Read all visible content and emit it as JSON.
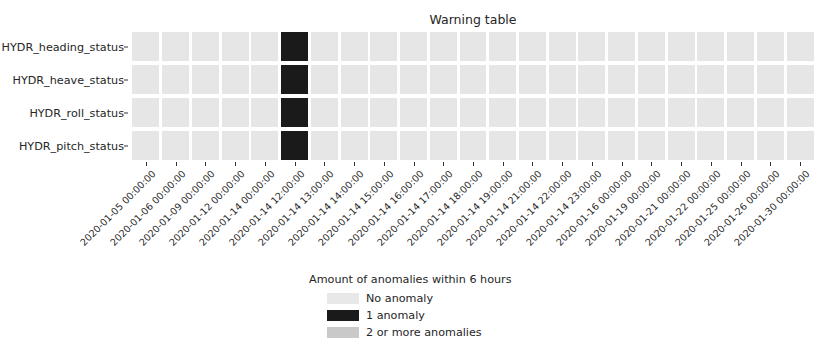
{
  "chart_data": {
    "type": "heatmap",
    "title": "Warning table",
    "xlabel": "",
    "ylabel": "",
    "grid": false,
    "legend_position": "below-center",
    "rows": [
      "HYDR_heading_status",
      "HYDR_heave_status",
      "HYDR_roll_status",
      "HYDR_pitch_status"
    ],
    "categories": [
      "2020-01-05 00:00:00",
      "2020-01-06 00:00:00",
      "2020-01-09 00:00:00",
      "2020-01-12 00:00:00",
      "2020-01-14 00:00:00",
      "2020-01-14 12:00:00",
      "2020-01-14 13:00:00",
      "2020-01-14 14:00:00",
      "2020-01-14 15:00:00",
      "2020-01-14 16:00:00",
      "2020-01-14 17:00:00",
      "2020-01-14 18:00:00",
      "2020-01-14 19:00:00",
      "2020-01-14 21:00:00",
      "2020-01-14 22:00:00",
      "2020-01-14 23:00:00",
      "2020-01-16 00:00:00",
      "2020-01-19 00:00:00",
      "2020-01-21 00:00:00",
      "2020-01-22 00:00:00",
      "2020-01-25 00:00:00",
      "2020-01-26 00:00:00",
      "2020-01-30 00:00:00"
    ],
    "series": [
      {
        "name": "HYDR_heading_status",
        "values": [
          0,
          0,
          0,
          0,
          0,
          1,
          0,
          0,
          0,
          0,
          0,
          0,
          0,
          0,
          0,
          0,
          0,
          0,
          0,
          0,
          0,
          0,
          0
        ]
      },
      {
        "name": "HYDR_heave_status",
        "values": [
          0,
          0,
          0,
          0,
          0,
          1,
          0,
          0,
          0,
          0,
          0,
          0,
          0,
          0,
          0,
          0,
          0,
          0,
          0,
          0,
          0,
          0,
          0
        ]
      },
      {
        "name": "HYDR_roll_status",
        "values": [
          0,
          0,
          0,
          0,
          0,
          1,
          0,
          0,
          0,
          0,
          0,
          0,
          0,
          0,
          0,
          0,
          0,
          0,
          0,
          0,
          0,
          0,
          0
        ]
      },
      {
        "name": "HYDR_pitch_status",
        "values": [
          0,
          0,
          0,
          0,
          0,
          1,
          0,
          0,
          0,
          0,
          0,
          0,
          0,
          0,
          0,
          0,
          0,
          0,
          0,
          0,
          0,
          0,
          0
        ]
      }
    ],
    "value_colors": {
      "0": "#e6e6e6",
      "1": "#1a1a1a",
      "2": "#c9c9c9"
    },
    "legend": {
      "title": "Amount of anomalies within 6 hours",
      "entries": [
        {
          "label": "No anomaly",
          "color": "#e8e8e8",
          "value": 0
        },
        {
          "label": "1 anomaly",
          "color": "#1a1a1a",
          "value": 1
        },
        {
          "label": "2 or more anomalies",
          "color": "#c9c9c9",
          "value": 2
        }
      ]
    }
  }
}
